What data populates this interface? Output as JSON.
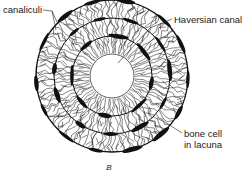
{
  "figure": {
    "type": "haversian-system-cross-section",
    "caption": "B",
    "center": [
      112,
      76
    ],
    "canal_radius": 22,
    "ring_radii": [
      40,
      58,
      76
    ],
    "ink_color": "#111111",
    "background": "#ffffff"
  },
  "labels": {
    "canaliculi": "canaliculi",
    "haversian_canal": "Haversian canal",
    "bone_cell_line1": "bone cell",
    "bone_cell_line2": "in lacuna"
  }
}
